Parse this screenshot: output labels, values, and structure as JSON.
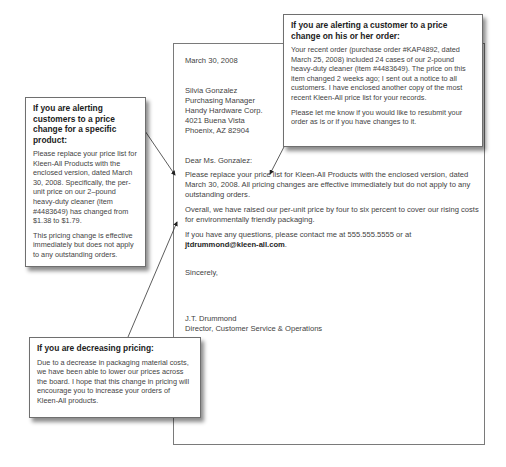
{
  "letter": {
    "date": "March 30, 2008",
    "recipient": {
      "name": "Silvia Gonzalez",
      "title": "Purchasing Manager",
      "company": "Handy Hardware Corp.",
      "street": "4021 Buena Vista",
      "city_state_zip": "Phoenix, AZ 82904"
    },
    "salutation": "Dear Ms. Gonzalez:",
    "paragraph1": "Please replace your price list for Kleen-All Products with the enclosed version, dated March 30, 2008. All pricing changes are effective immediately but do not apply to any outstanding orders.",
    "paragraph2": "Overall, we have raised our per-unit price by four to six percent to cover our rising costs for environmentally friendly packaging.",
    "paragraph3_prefix": "If you have any questions, please contact me at 555.555.5555 or at",
    "paragraph3_email": "jtdrummond@kleen-all.com",
    "paragraph3_suffix": ".",
    "closing": "Sincerely,",
    "signer_name": "J.T. Drummond",
    "signer_title": "Director, Customer Service & Operations"
  },
  "callouts": {
    "order_change": {
      "heading": "If you are alerting a customer to a price change on his or her order:",
      "body1": "Your recent order (purchase order #KAP4892, dated March 25, 2008) included 24 cases of our 2-pound heavy-duty cleaner (item #4483649). The price on this item changed 2 weeks ago; I sent out a notice to all customers. I have enclosed another copy of the most recent Kleen-All price list for your records.",
      "body2": "Please let me know if you would like to resubmit your order as is or if you have changes to it."
    },
    "product_change": {
      "heading": "If you are alerting customers to a price change for a specific product:",
      "body1": "Please replace your price list for Kleen-All Products with the enclosed version, dated March 30, 2008. Specifically, the per-unit price on our 2–pound heavy-duty cleaner (item #4483649) has changed from $1.38 to $1.79.",
      "body2": "This pricing change is effective immediately but does not apply to any outstanding orders."
    },
    "decreasing": {
      "heading": "If you are decreasing pricing:",
      "body1": "Due to a decrease in packaging material costs, we have been able to lower our prices across the board. I hope that this change in pricing will encourage you to increase your orders of Kleen-All products."
    }
  }
}
